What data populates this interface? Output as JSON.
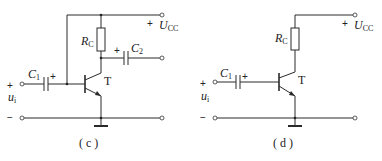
{
  "circuits": [
    {
      "id": "c",
      "caption": "( c )",
      "supply": {
        "sign": "+",
        "label": "U",
        "sub": "CC"
      },
      "resistor": {
        "label": "R",
        "sub": "C"
      },
      "input_cap": {
        "label": "C",
        "sub": "1",
        "polarity": "+"
      },
      "output_cap": {
        "label": "C",
        "sub": "2",
        "polarity": "+"
      },
      "transistor": {
        "label": "T"
      },
      "input": {
        "plus": "+",
        "minus": "−",
        "label": "u",
        "sub": "i"
      }
    },
    {
      "id": "d",
      "caption": "( d )",
      "supply": {
        "sign": "+",
        "label": "U",
        "sub": "CC"
      },
      "resistor": {
        "label": "R",
        "sub": "C"
      },
      "input_cap": {
        "label": "C",
        "sub": "1",
        "polarity": "+"
      },
      "transistor": {
        "label": "T"
      },
      "input": {
        "plus": "+",
        "minus": "−",
        "label": "u",
        "sub": "i"
      }
    }
  ]
}
